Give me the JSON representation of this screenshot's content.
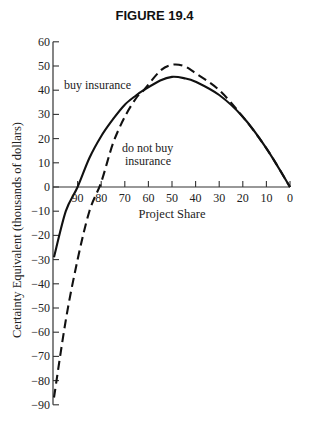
{
  "chart_data": {
    "type": "line",
    "title": "FIGURE 19.4",
    "xlabel": "Project Share",
    "ylabel": "Certainty Equivalent (thousands of dollars)",
    "x_reversed": true,
    "xlim": [
      100,
      0
    ],
    "ylim": [
      -90,
      60
    ],
    "x_ticks": [
      90,
      80,
      70,
      60,
      50,
      40,
      30,
      20,
      10,
      0
    ],
    "y_ticks": [
      60,
      50,
      40,
      30,
      20,
      10,
      0,
      -10,
      -20,
      -30,
      -40,
      -50,
      -60,
      -70,
      -80,
      -90
    ],
    "grid": false,
    "legend": "none (inline annotations)",
    "x": [
      100,
      95,
      90,
      85,
      80,
      75,
      70,
      65,
      62,
      55,
      50,
      45,
      40,
      30,
      20,
      10,
      0
    ],
    "series": [
      {
        "name": "buy insurance",
        "style": "solid",
        "values": [
          -29,
          -10,
          0,
          12,
          21,
          28,
          34,
          38,
          40,
          44,
          45.5,
          45,
          43.5,
          38,
          29,
          16,
          0
        ]
      },
      {
        "name": "do not buy insurance",
        "style": "dashed",
        "values": [
          -87,
          -55,
          -30,
          -10,
          2,
          18,
          29,
          37,
          40,
          48,
          50.5,
          50,
          47,
          40,
          29,
          16,
          0
        ]
      }
    ],
    "annotations": [
      {
        "text": "buy insurance",
        "near": "solid curve, share ≈ 85, value ≈ 42"
      },
      {
        "text": "do not buy insurance",
        "near": "dashed curve, share ≈ 75, value ≈ 15"
      }
    ]
  },
  "labels": {
    "title": "FIGURE 19.4",
    "xlabel": "Project Share",
    "ylabel": "Certainty Equivalent (thousands of dollars)",
    "annot_buy": "buy insurance",
    "annot_nobuy_1": "do not buy",
    "annot_nobuy_2": "insurance"
  }
}
